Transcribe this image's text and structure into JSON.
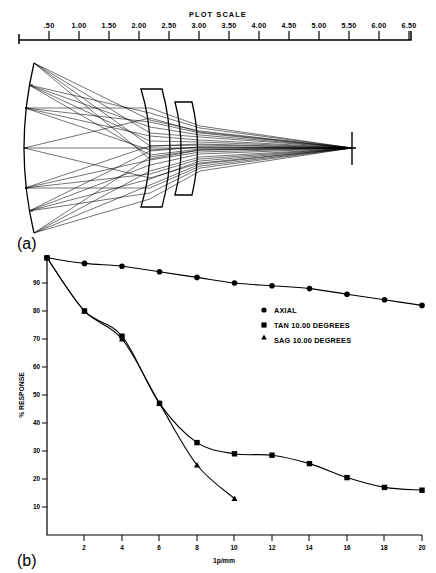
{
  "figure": {
    "panel_a_label": "(a)",
    "panel_b_label": "(b)"
  },
  "plot_scale": {
    "title": "PLOT SCALE",
    "ticks": [
      "  .50",
      "1.00",
      "1.50",
      "2.00",
      "2.50",
      "3.00",
      "3.50",
      "4.00",
      "4.50",
      "5.00",
      "5.50",
      "6.00",
      "6.50"
    ]
  },
  "ray_diagram": {
    "name": "lens-ray-trace",
    "elements": [
      "object-arc",
      "lens-element-1",
      "lens-element-2",
      "optical-axis",
      "image-plane"
    ]
  },
  "legend": {
    "items": [
      {
        "marker": "circle",
        "label": "AXIAL"
      },
      {
        "marker": "square",
        "label": "TAN 10.00 DEGREES"
      },
      {
        "marker": "triangle",
        "label": "SAG 10.00 DEGREES"
      }
    ]
  },
  "chart_data": {
    "type": "line",
    "title": "",
    "xlabel": "1p/mm",
    "ylabel": "% RESPONSE",
    "xlim": [
      0,
      20
    ],
    "ylim": [
      0,
      100
    ],
    "grid": false,
    "legend_position": "center-right",
    "xticks": [
      2,
      4,
      6,
      8,
      10,
      12,
      14,
      16,
      18,
      20
    ],
    "xtick_labels": [
      "2",
      "4",
      "6",
      "8",
      "10",
      "12",
      "14",
      "16",
      "18",
      "20"
    ],
    "yticks": [
      10,
      20,
      30,
      40,
      50,
      60,
      70,
      80,
      90
    ],
    "ytick_labels": [
      "10",
      "20",
      "30",
      "40",
      "50",
      "60",
      "70",
      "80",
      "90"
    ],
    "series": [
      {
        "name": "AXIAL",
        "marker": "circle",
        "x": [
          0,
          2,
          4,
          6,
          8,
          10,
          12,
          14,
          16,
          18,
          20
        ],
        "values": [
          99,
          97,
          96,
          94,
          92,
          90,
          89,
          88,
          86,
          84,
          82
        ]
      },
      {
        "name": "TAN 10.00 DEGREES",
        "marker": "square",
        "x": [
          0,
          2,
          4,
          6,
          8,
          10,
          12,
          14,
          16,
          18,
          20
        ],
        "values": [
          99,
          80,
          71,
          47,
          33,
          29,
          28.5,
          25.5,
          20.5,
          17,
          16
        ]
      },
      {
        "name": "SAG 10.00 DEGREES",
        "marker": "triangle",
        "x": [
          0,
          2,
          4,
          6,
          8,
          10
        ],
        "values": [
          99,
          80,
          70,
          47,
          25,
          13
        ]
      }
    ]
  }
}
